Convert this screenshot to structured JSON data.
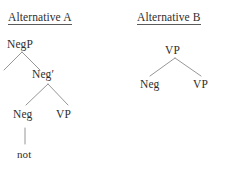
{
  "figure": {
    "background_color": "#ffffff",
    "text_color": "#2e2e2e",
    "line_color": "#8a8a8a",
    "width": 226,
    "height": 169
  },
  "panels": [
    {
      "id": "alternative-a",
      "title": "Alternative A",
      "tree": {
        "root_label": "NegP",
        "nodes": [
          {
            "key": "negp",
            "label": "NegP",
            "x": 7,
            "y": 38,
            "type": "nonterminal"
          },
          {
            "key": "negbar",
            "label": "Neg′",
            "x": 32,
            "y": 68,
            "type": "nonterminal"
          },
          {
            "key": "neg",
            "label": "Neg",
            "x": 13,
            "y": 108,
            "type": "nonterminal"
          },
          {
            "key": "vp",
            "label": "VP",
            "x": 56,
            "y": 108,
            "type": "nonterminal"
          },
          {
            "key": "not",
            "label": "not",
            "x": 17,
            "y": 148,
            "type": "terminal"
          }
        ],
        "edges": [
          {
            "from": "negp",
            "to": "left-specifier",
            "x1": 22,
            "y1": 52,
            "x2": 4,
            "y2": 70
          },
          {
            "from": "negp",
            "to": "negbar",
            "x1": 22,
            "y1": 52,
            "x2": 40,
            "y2": 70
          },
          {
            "from": "negbar",
            "to": "neg",
            "x1": 48,
            "y1": 84,
            "x2": 26,
            "y2": 105
          },
          {
            "from": "negbar",
            "to": "vp",
            "x1": 48,
            "y1": 84,
            "x2": 68,
            "y2": 105
          },
          {
            "from": "neg",
            "to": "not",
            "x1": 25,
            "y1": 128,
            "x2": 25,
            "y2": 144
          }
        ]
      }
    },
    {
      "id": "alternative-b",
      "title": "Alternative B",
      "tree": {
        "root_label": "VP",
        "nodes": [
          {
            "key": "vp-top",
            "label": "VP",
            "x": 165,
            "y": 44,
            "type": "nonterminal"
          },
          {
            "key": "neg",
            "label": "Neg",
            "x": 140,
            "y": 78,
            "type": "nonterminal"
          },
          {
            "key": "vp",
            "label": "VP",
            "x": 193,
            "y": 78,
            "type": "nonterminal"
          }
        ],
        "edges": [
          {
            "from": "vp-top",
            "to": "neg",
            "x1": 175,
            "y1": 58,
            "x2": 150,
            "y2": 76
          },
          {
            "from": "vp-top",
            "to": "vp",
            "x1": 175,
            "y1": 58,
            "x2": 201,
            "y2": 76
          }
        ]
      }
    }
  ]
}
